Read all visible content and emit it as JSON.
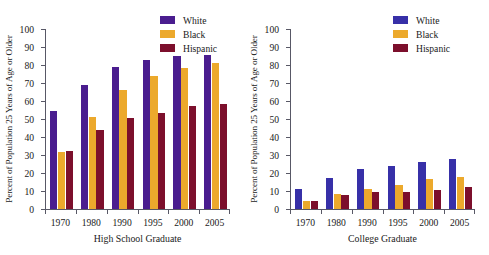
{
  "chart_data": [
    {
      "type": "bar",
      "title": "",
      "xlabel": "High School Graduate",
      "ylabel": "Percent of Population 25 Years of Age or Older",
      "categories": [
        "1970",
        "1980",
        "1990",
        "1995",
        "2000",
        "2005"
      ],
      "ylim": [
        0,
        100
      ],
      "yticks": [
        0,
        10,
        20,
        30,
        40,
        50,
        60,
        70,
        80,
        90,
        100
      ],
      "grid": false,
      "legend_position": "top-right",
      "series": [
        {
          "name": "White",
          "color": "#4a1d8f",
          "values": [
            54.5,
            68.8,
            79.1,
            83.0,
            84.9,
            85.8
          ]
        },
        {
          "name": "Black",
          "color": "#eca92c",
          "values": [
            31.4,
            51.2,
            66.2,
            73.8,
            78.5,
            81.1
          ]
        },
        {
          "name": "Hispanic",
          "color": "#7c0f2c",
          "values": [
            32.1,
            44.0,
            50.8,
            53.4,
            57.0,
            58.5
          ]
        }
      ]
    },
    {
      "type": "bar",
      "title": "",
      "xlabel": "College Graduate",
      "ylabel": "Percent of Population 25 Years of Age or Older",
      "categories": [
        "1970",
        "1980",
        "1990",
        "1995",
        "2000",
        "2005"
      ],
      "ylim": [
        0,
        100
      ],
      "yticks": [
        0,
        10,
        20,
        30,
        40,
        50,
        60,
        70,
        80,
        90,
        100
      ],
      "grid": false,
      "legend_position": "top-right",
      "series": [
        {
          "name": "White",
          "color": "#3730a8",
          "values": [
            11.3,
            17.1,
            22.0,
            24.0,
            26.1,
            28.0
          ]
        },
        {
          "name": "Black",
          "color": "#eca92c",
          "values": [
            4.4,
            8.4,
            11.3,
            13.2,
            16.5,
            17.6
          ]
        },
        {
          "name": "Hispanic",
          "color": "#7c0f2c",
          "values": [
            4.5,
            7.6,
            9.2,
            9.3,
            10.6,
            12.0
          ]
        }
      ]
    }
  ],
  "charts": [
    {
      "id": "high-school-graduate",
      "xlabel": "High School Graduate",
      "ylabel": "Percent of Population 25 Years of Age or Older",
      "legend": [
        {
          "label": "White",
          "color": "#4a1d8f"
        },
        {
          "label": "Black",
          "color": "#eca92c"
        },
        {
          "label": "Hispanic",
          "color": "#7c0f2c"
        }
      ]
    },
    {
      "id": "college-graduate",
      "xlabel": "College Graduate",
      "ylabel": "Percent of Population 25 Years of Age or Older",
      "legend": [
        {
          "label": "White",
          "color": "#3730a8"
        },
        {
          "label": "Black",
          "color": "#eca92c"
        },
        {
          "label": "Hispanic",
          "color": "#7c0f2c"
        }
      ]
    }
  ]
}
